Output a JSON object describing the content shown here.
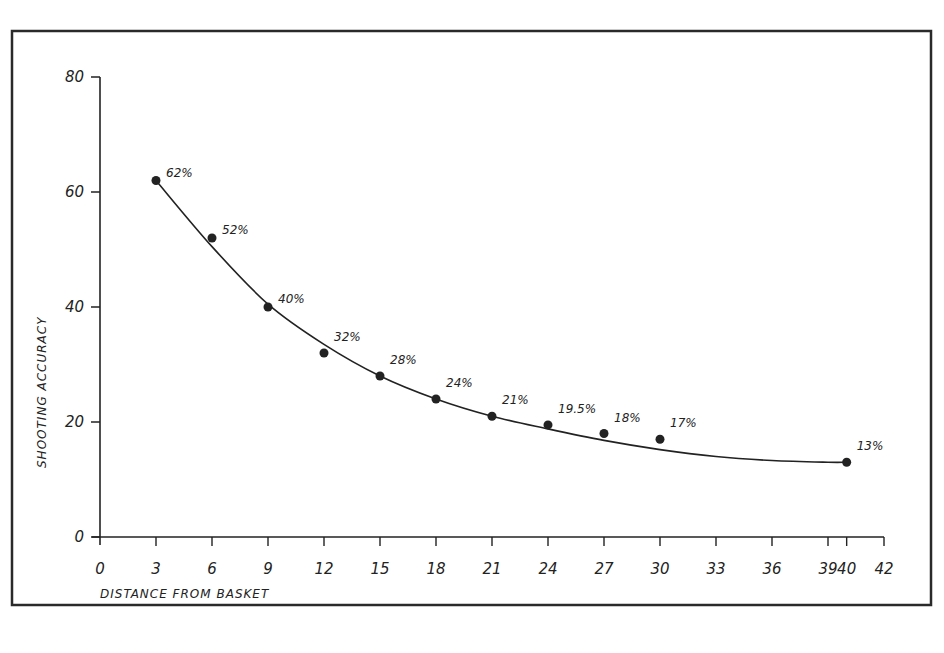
{
  "chart_data": {
    "type": "scatter",
    "title": "",
    "xlabel": "DISTANCE FROM BASKET",
    "ylabel": "SHOOTING ACCURACY",
    "xlim": [
      0,
      42
    ],
    "ylim": [
      0,
      80
    ],
    "grid": false,
    "legend": "none",
    "x_ticks": [
      0,
      3,
      6,
      9,
      12,
      15,
      18,
      21,
      24,
      27,
      30,
      33,
      36,
      39,
      40,
      42
    ],
    "x_tick_labels": [
      "0",
      "3",
      "6",
      "9",
      "12",
      "15",
      "18",
      "21",
      "24",
      "27",
      "30",
      "33",
      "36",
      "39",
      "40",
      "42"
    ],
    "y_ticks": [
      0,
      20,
      40,
      60,
      80
    ],
    "y_tick_labels": [
      "0",
      "20",
      "40",
      "60",
      "80"
    ],
    "series": [
      {
        "name": "Shooting accuracy",
        "x": [
          3,
          6,
          9,
          12,
          15,
          18,
          21,
          24,
          27,
          30,
          40
        ],
        "y": [
          62,
          52,
          40,
          32,
          28,
          24,
          21,
          19.5,
          18,
          17,
          13
        ],
        "labels": [
          "62%",
          "52%",
          "40%",
          "32%",
          "28%",
          "24%",
          "21%",
          "19.5%",
          "18%",
          "17%",
          "13%"
        ]
      }
    ],
    "trend_curve": {
      "name": "Fitted curve",
      "x": [
        3,
        6,
        9,
        12,
        15,
        18,
        21,
        24,
        27,
        30,
        33,
        36,
        39,
        40
      ],
      "y": [
        62,
        50.5,
        40.5,
        33.5,
        28,
        24,
        21,
        18.8,
        16.8,
        15.2,
        14,
        13.3,
        13,
        13
      ]
    },
    "colors": {
      "ink": "#222222",
      "background": "#ffffff",
      "frame": "#2a2a2a"
    }
  }
}
